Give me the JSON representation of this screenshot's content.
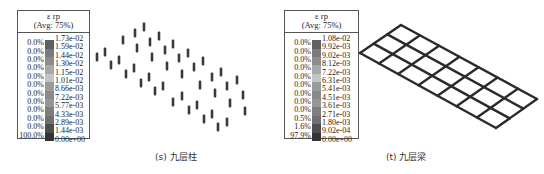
{
  "figures": [
    {
      "id": "s",
      "caption": "(s) 九层柱",
      "legend": {
        "title": "ε rp",
        "subtitle": "(Avg: 75%)",
        "values": [
          "1.73e-02",
          "1.59e-02",
          "1.44e-02",
          "1.30e-02",
          "1.15e-02",
          "1.01e-02",
          "8.66e-03",
          "7.22e-03",
          "5.77e-03",
          "4.33e-03",
          "2.89e-03",
          "1.44e-03",
          "0.00e+00"
        ],
        "percents": [
          "0.0%",
          "0.0%",
          "0.0%",
          "0.0%",
          "0.0%",
          "0.0%",
          "0.0%",
          "0.0%",
          "0.0%",
          "0.0%",
          "0.0%",
          "100.0%"
        ],
        "swatch_colors": [
          "#606060",
          "#7a7a7a",
          "#8c8c8c",
          "#a8a8a8",
          "#c4c4c4",
          "#9a9a9a",
          "#8a8a8a",
          "#969696",
          "#7e7e7e",
          "#707070",
          "#4e4e4e",
          "#333333"
        ]
      },
      "model": "column-grid",
      "element_color": "#3a3a3a"
    },
    {
      "id": "t",
      "caption": "(t) 九层梁",
      "legend": {
        "title": "ε rp",
        "subtitle": "(Avg: 75%)",
        "values": [
          "1.08e-02",
          "9.92e-03",
          "9.02e-03",
          "8.12e-03",
          "7.22e-03",
          "6.31e-03",
          "5.41e-03",
          "4.51e-03",
          "3.61e-03",
          "2.71e-03",
          "1.80e-03",
          "9.02e-04",
          "0.00e+00"
        ],
        "percents": [
          "0.0%",
          "0.0%",
          "0.0%",
          "0.0%",
          "0.0%",
          "0.0%",
          "0.0%",
          "0.0%",
          "0.0%",
          "0.5%",
          "1.6%",
          "97.9%"
        ],
        "swatch_colors": [
          "#606060",
          "#7a7a7a",
          "#8c8c8c",
          "#a8a8a8",
          "#c4c4c4",
          "#9a9a9a",
          "#8a8a8a",
          "#969696",
          "#7e7e7e",
          "#707070",
          "#4e4e4e",
          "#333333"
        ]
      },
      "model": "beam-grid",
      "element_color": "#2a2a2a"
    }
  ]
}
